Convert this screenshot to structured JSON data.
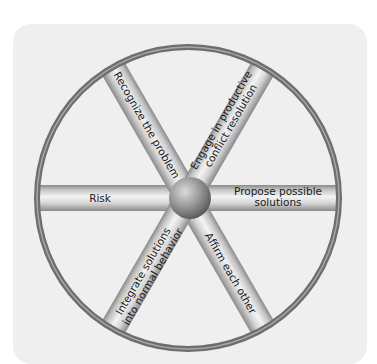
{
  "diagram": {
    "type": "wheel",
    "hub": {
      "label": ""
    },
    "spokes": [
      {
        "id": "risk",
        "label_lines": [
          "Risk"
        ],
        "position": "left"
      },
      {
        "id": "propose",
        "label_lines": [
          "Propose possible",
          "solutions"
        ],
        "position": "right"
      },
      {
        "id": "recognize",
        "label_lines": [
          "Recognize the problem"
        ],
        "position": "upper-left"
      },
      {
        "id": "engage",
        "label_lines": [
          "Engage in productive",
          "conflict resolution"
        ],
        "position": "upper-right"
      },
      {
        "id": "integrate",
        "label_lines": [
          "Integrate solutions",
          "into normal behavior"
        ],
        "position": "lower-left"
      },
      {
        "id": "affirm",
        "label_lines": [
          "Affirm each other"
        ],
        "position": "lower-right"
      }
    ],
    "colors": {
      "card_background": "#efefef",
      "rim": "#777777",
      "spoke_edge": "#8a8a8a",
      "spoke_center": "#f4f4f4",
      "hub_light": "#d8d8d8",
      "hub_dark": "#5a5a5a",
      "text": "#1a1a1a"
    }
  }
}
